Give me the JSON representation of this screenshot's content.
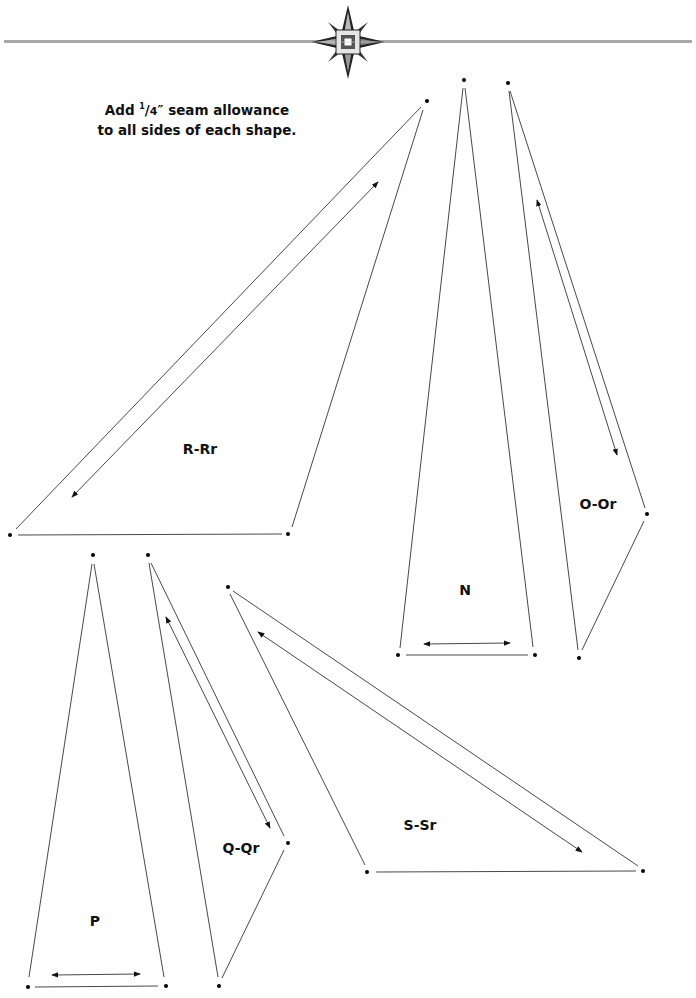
{
  "header": {
    "ornament": "star-medallion-icon"
  },
  "instructions": {
    "line1_pre": "Add ",
    "fraction_num": "1",
    "fraction_den": "4",
    "line1_post": "″ seam allowance",
    "line2": "to all sides of each shape."
  },
  "shapes": [
    {
      "label": "R-Rr",
      "label_pos": [
        200,
        449
      ]
    },
    {
      "label": "N",
      "label_pos": [
        465,
        590
      ]
    },
    {
      "label": "O-Or",
      "label_pos": [
        598,
        504
      ]
    },
    {
      "label": "P",
      "label_pos": [
        95,
        921
      ]
    },
    {
      "label": "Q-Qr",
      "label_pos": [
        241,
        848
      ]
    },
    {
      "label": "S-Sr",
      "label_pos": [
        420,
        825
      ]
    }
  ]
}
